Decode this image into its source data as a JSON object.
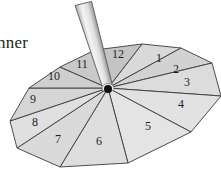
{
  "caption_fragment": "nner",
  "spinner": {
    "center": [
      108,
      88
    ],
    "sections": [
      {
        "label": "1",
        "pos": [
          159,
          62
        ]
      },
      {
        "label": "2",
        "pos": [
          176,
          73
        ]
      },
      {
        "label": "3",
        "pos": [
          187,
          86
        ]
      },
      {
        "label": "4",
        "pos": [
          181,
          108
        ]
      },
      {
        "label": "5",
        "pos": [
          148,
          130
        ]
      },
      {
        "label": "6",
        "pos": [
          99,
          145
        ]
      },
      {
        "label": "7",
        "pos": [
          58,
          143
        ]
      },
      {
        "label": "8",
        "pos": [
          35,
          126
        ]
      },
      {
        "label": "9",
        "pos": [
          33,
          103
        ]
      },
      {
        "label": "10",
        "pos": [
          54,
          80
        ]
      },
      {
        "label": "11",
        "pos": [
          82,
          68
        ]
      },
      {
        "label": "12",
        "pos": [
          118,
          58
        ]
      }
    ],
    "vertices": [
      [
        142,
        44
      ],
      [
        181,
        48
      ],
      [
        212,
        63
      ],
      [
        221,
        96
      ],
      [
        191,
        132
      ],
      [
        128,
        163
      ],
      [
        60,
        167
      ],
      [
        17,
        148
      ],
      [
        10,
        121
      ],
      [
        29,
        88
      ],
      [
        60,
        67
      ],
      [
        95,
        50
      ]
    ],
    "colors": {
      "fill_light": "#e6e6e6",
      "fill_dark": "#bdbdbd",
      "stroke": "#3a3a3a",
      "pole_light": "#f2f2f2",
      "pole_dark": "#b5b5b5",
      "pivot": "#111111"
    }
  }
}
